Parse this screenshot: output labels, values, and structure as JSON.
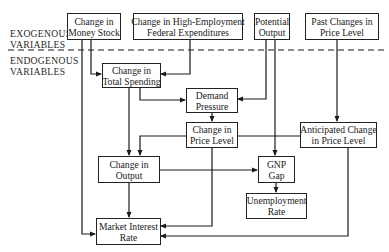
{
  "diagram": {
    "sections": {
      "exogenous": [
        "EXOGENOUS",
        "VARIABLES"
      ],
      "endogenous": [
        "ENDOGENOUS",
        "VARIABLES"
      ]
    },
    "nodes": {
      "money_stock": [
        "Change in",
        "Money Stock"
      ],
      "fed_expenditures": [
        "Change in High-Employment",
        "Federal Expenditures"
      ],
      "potential_output": [
        "Potential",
        "Output"
      ],
      "past_price": [
        "Past Changes in",
        "Price Level"
      ],
      "total_spending": [
        "Change in",
        "Total Spending"
      ],
      "demand_pressure": [
        "Demand",
        "Pressure"
      ],
      "price_level": [
        "Change in",
        "Price Level"
      ],
      "anticipated_price": [
        "Anticipated Change",
        "in Price Level"
      ],
      "output": [
        "Change in",
        "Output"
      ],
      "gnp_gap": [
        "GNP",
        "Gap"
      ],
      "unemployment": [
        "Unemployment",
        "Rate"
      ],
      "interest_rate": [
        "Market Interest",
        "Rate"
      ]
    },
    "edges": [
      [
        "money_stock",
        "total_spending"
      ],
      [
        "money_stock",
        "interest_rate"
      ],
      [
        "fed_expenditures",
        "total_spending"
      ],
      [
        "potential_output",
        "demand_pressure"
      ],
      [
        "potential_output",
        "gnp_gap"
      ],
      [
        "past_price",
        "anticipated_price"
      ],
      [
        "total_spending",
        "demand_pressure"
      ],
      [
        "total_spending",
        "output"
      ],
      [
        "demand_pressure",
        "price_level"
      ],
      [
        "price_level",
        "output"
      ],
      [
        "price_level",
        "interest_rate"
      ],
      [
        "anticipated_price",
        "price_level"
      ],
      [
        "anticipated_price",
        "interest_rate"
      ],
      [
        "output",
        "gnp_gap"
      ],
      [
        "output",
        "interest_rate"
      ],
      [
        "gnp_gap",
        "unemployment"
      ]
    ]
  }
}
